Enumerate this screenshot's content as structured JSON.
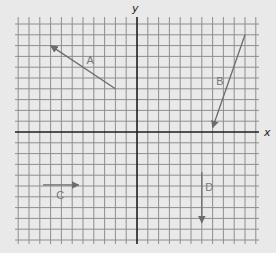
{
  "diagram": {
    "type": "coordinate-grid-vectors",
    "axes": {
      "x_label": "x",
      "y_label": "y"
    },
    "grid": {
      "origin_px": [
        137,
        132
      ],
      "cell_px": 10.8,
      "x_range": [
        -11,
        11
      ],
      "y_range": [
        -10.5,
        10.5
      ]
    },
    "colors": {
      "background": "#e9e9e9",
      "grid": "#8e8e8e",
      "axis": "#1e1e1e",
      "vector": "#6c6c6c",
      "label": "#777777"
    },
    "vectors": [
      {
        "label": "A",
        "tail": [
          -2,
          4
        ],
        "head": [
          -8,
          8
        ],
        "label_pos": [
          -4.3,
          6.7
        ]
      },
      {
        "label": "B",
        "tail": [
          10,
          9
        ],
        "head": [
          7,
          0.4
        ],
        "label_pos": [
          7.7,
          4.7
        ]
      },
      {
        "label": "C",
        "tail": [
          -8.7,
          -4.9
        ],
        "head": [
          -5.4,
          -4.9
        ],
        "label_pos": [
          -7.1,
          -5.8
        ]
      },
      {
        "label": "D",
        "tail": [
          6,
          -3.7
        ],
        "head": [
          6,
          -8.4
        ],
        "label_pos": [
          6.7,
          -5.1
        ]
      }
    ]
  }
}
